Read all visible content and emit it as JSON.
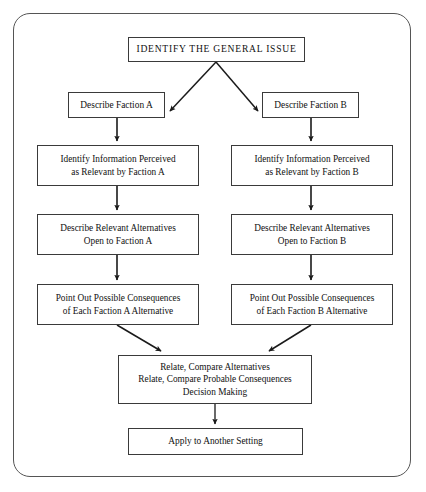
{
  "diagram": {
    "title_node": "IDENTIFY THE GENERAL ISSUE",
    "nodes": {
      "root": {
        "text": "IDENTIFY THE GENERAL ISSUE"
      },
      "faction_a_describe": {
        "text": "Describe Faction A"
      },
      "faction_b_describe": {
        "text": "Describe Faction B"
      },
      "faction_a_identify": {
        "line1": "Identify Information Perceived",
        "line2": "as Relevant by Faction A"
      },
      "faction_b_identify": {
        "line1": "Identify Information Perceived",
        "line2": "as Relevant by Faction B"
      },
      "faction_a_alternatives": {
        "line1": "Describe Relevant Alternatives",
        "line2": "Open to Faction A"
      },
      "faction_b_alternatives": {
        "line1": "Describe Relevant Alternatives",
        "line2": "Open to Faction B"
      },
      "faction_a_consequences": {
        "line1": "Point Out Possible Consequences",
        "line2": "of Each Faction A Alternative"
      },
      "faction_b_consequences": {
        "line1": "Point Out Possible Consequences",
        "line2": "of Each Faction B Alternative"
      },
      "synthesis": {
        "line1": "Relate, Compare Alternatives",
        "line2": "Relate, Compare Probable Consequences",
        "line3": "Decision Making"
      },
      "apply": {
        "text": "Apply to Another Setting"
      }
    },
    "colors": {
      "frame_stroke": "#555555",
      "box_stroke": "#3a3a3a",
      "connector_stroke": "#1a1a1a",
      "text": "#111111",
      "background": "#ffffff"
    }
  }
}
